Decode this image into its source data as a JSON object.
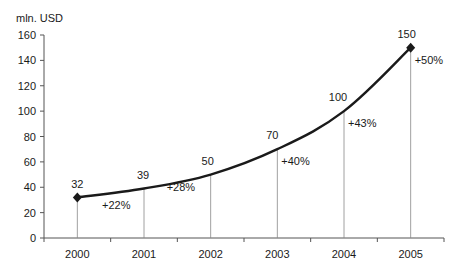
{
  "chart_data": {
    "type": "line",
    "title": "",
    "ylabel": "mln. USD",
    "xlabel": "",
    "categories": [
      "2000",
      "2001",
      "2002",
      "2003",
      "2004",
      "2005"
    ],
    "series": [
      {
        "name": "Revenue",
        "values": [
          32,
          39,
          50,
          70,
          100,
          150
        ]
      }
    ],
    "growth_labels": [
      "",
      "+22%",
      "+28%",
      "+40%",
      "+43%",
      "+50%"
    ],
    "value_labels": [
      "32",
      "39",
      "50",
      "70",
      "100",
      "150"
    ],
    "yticks": [
      0,
      20,
      40,
      60,
      80,
      100,
      120,
      140,
      160
    ],
    "ylim": [
      0,
      160
    ],
    "grid": false,
    "legend": "none",
    "line_color": "#1a1a1a",
    "drop_line_color": "#888888",
    "markers": "diamond on first and last point"
  }
}
